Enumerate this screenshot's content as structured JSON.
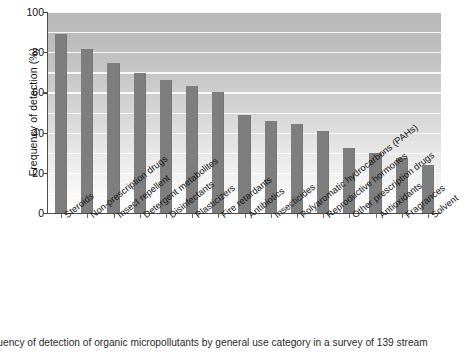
{
  "chart_data": {
    "type": "bar",
    "title": "",
    "xlabel": "",
    "ylabel": "Frequency of detection (%)",
    "ylim": [
      0,
      100
    ],
    "yticks": [
      0,
      20,
      40,
      60,
      80,
      100
    ],
    "ytick_labels": [
      "0",
      "20",
      "40",
      "60",
      "80",
      "100"
    ],
    "gridlines": [
      10,
      20,
      30,
      40,
      50,
      60,
      70,
      80,
      90,
      100
    ],
    "grid": true,
    "legend": null,
    "bar_color": "#7e7e7e",
    "plot_background": "vertical gray gradient, dark at top to white at bottom",
    "categories": [
      "Steroids",
      "Non-prescription drugs",
      "Insect repellent",
      "Detergent metabolites",
      "Disinfectants",
      "Plasticizers",
      "Fire retardants",
      "Antibiotics",
      "Insecticides",
      "Polyaromatic hydrocarbons (PAHs)",
      "Reproductive hormones",
      "Other prescription drugs",
      "Antioxidants",
      "Fragrances",
      "Solvent"
    ],
    "values": [
      89,
      81.5,
      74.5,
      69.5,
      66,
      63,
      60,
      49,
      46,
      44.5,
      41,
      32.5,
      30,
      27.5,
      24
    ]
  },
  "caption": {
    "text": "equency of detection of organic micropollutants by general use category in a survey of 139 stream"
  }
}
